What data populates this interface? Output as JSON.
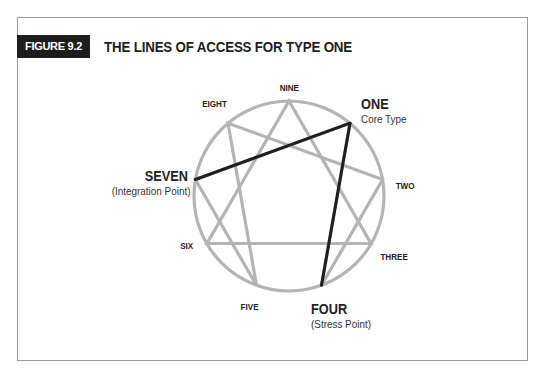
{
  "figure": {
    "badge": "FIGURE 9.2",
    "title": "THE LINES OF ACCESS FOR TYPE ONE"
  },
  "diagram": {
    "type": "enneagram",
    "points": {
      "nine": "NINE",
      "one": "ONE",
      "two": "TWO",
      "three": "THREE",
      "four": "FOUR",
      "five": "FIVE",
      "six": "SIX",
      "seven": "SEVEN",
      "eight": "EIGHT"
    },
    "annotations": {
      "one": "Core Type",
      "seven": "(Integration Point)",
      "four": "(Stress Point)"
    },
    "highlighted_lines": [
      {
        "from": "ONE",
        "to": "SEVEN",
        "meaning": "Integration"
      },
      {
        "from": "ONE",
        "to": "FOUR",
        "meaning": "Stress"
      }
    ],
    "colors": {
      "circle": "#b4b4b4",
      "highlight": "#1e1e1e"
    }
  }
}
